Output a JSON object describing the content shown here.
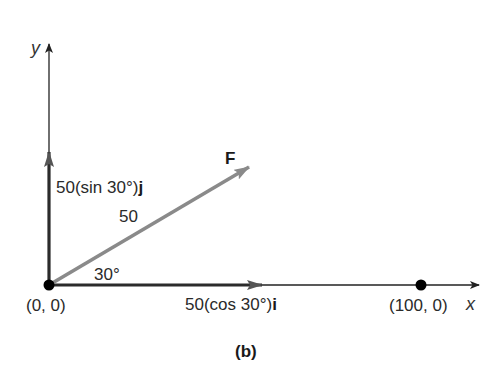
{
  "diagram": {
    "caption": "(b)",
    "axes": {
      "x_label": "x",
      "y_label": "y"
    },
    "points": {
      "origin_label": "(0, 0)",
      "end_label": "(100, 0)"
    },
    "force_vector": {
      "label": "F",
      "magnitude_label": "50",
      "angle_label": "30°",
      "magnitude": 50,
      "angle_deg": 30,
      "color": "#8a8a8a"
    },
    "components": {
      "vertical": {
        "prefix": "50(sin 30°)",
        "unit": "j"
      },
      "horizontal": {
        "prefix": "50(cos 30°)",
        "unit": "i"
      },
      "color": "#2b2b2b"
    },
    "colors": {
      "axis": "#222222",
      "point": "#000000",
      "background": "#ffffff"
    }
  }
}
